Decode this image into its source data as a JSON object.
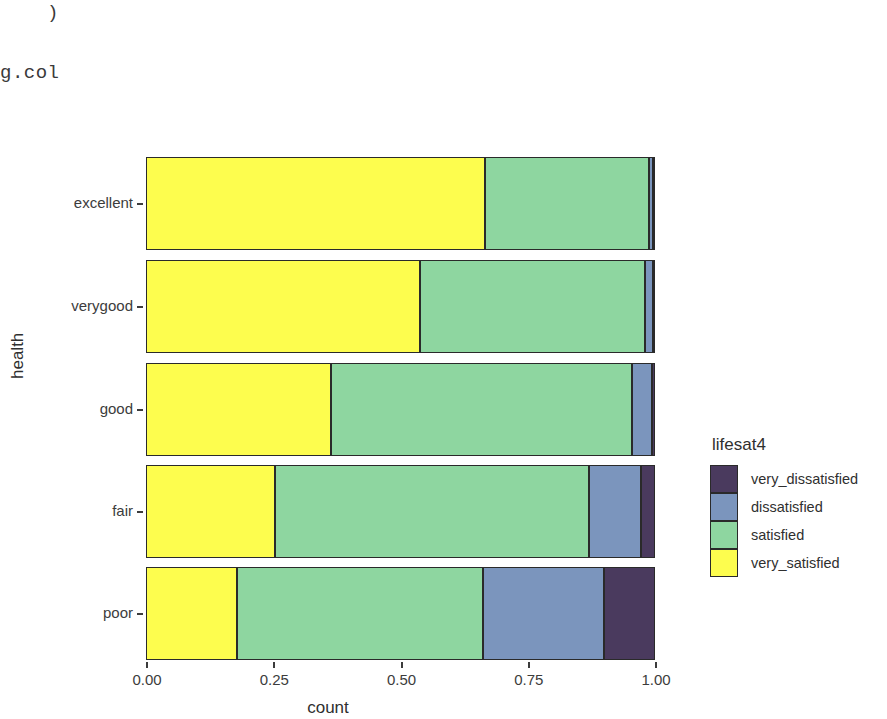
{
  "console": {
    "line1": ")",
    "line2": "g.col"
  },
  "legend": {
    "title": "lifesat4",
    "entries": [
      {
        "label": "very_dissatisfied",
        "color": "#4a3a5e"
      },
      {
        "label": "dissatisfied",
        "color": "#7b95bd"
      },
      {
        "label": "satisfied",
        "color": "#8ed6a0"
      },
      {
        "label": "very_satisfied",
        "color": "#fdfd4e"
      }
    ]
  },
  "chart_data": {
    "type": "bar",
    "orientation": "horizontal",
    "stacked": true,
    "title": "",
    "xlabel": "count",
    "ylabel": "health",
    "xlim": [
      0,
      1
    ],
    "xticks": [
      "0.00",
      "0.25",
      "0.50",
      "0.75",
      "1.00"
    ],
    "xtick_values": [
      0,
      0.25,
      0.5,
      0.75,
      1
    ],
    "categories": [
      "excellent",
      "verygood",
      "good",
      "fair",
      "poor"
    ],
    "grid": false,
    "legend_position": "right",
    "series": [
      {
        "name": "very_satisfied",
        "color": "#fdfd4e",
        "values": [
          0.665,
          0.537,
          0.363,
          0.254,
          0.178
        ]
      },
      {
        "name": "satisfied",
        "color": "#8ed6a0",
        "values": [
          0.322,
          0.442,
          0.592,
          0.615,
          0.484
        ]
      },
      {
        "name": "dissatisfied",
        "color": "#7b95bd",
        "values": [
          0.009,
          0.017,
          0.039,
          0.104,
          0.238
        ]
      },
      {
        "name": "very_dissatisfied",
        "color": "#4a3a5e",
        "values": [
          0.004,
          0.004,
          0.006,
          0.027,
          0.1
        ]
      }
    ]
  }
}
